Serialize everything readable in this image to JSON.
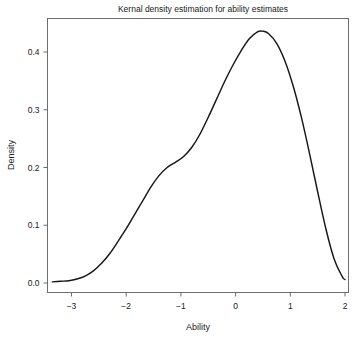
{
  "chart_data": {
    "type": "line",
    "title": "Kernal density estimation for ability estimates",
    "xlabel": "Ability",
    "ylabel": "Density",
    "xlim": [
      -3.35,
      2.0
    ],
    "ylim": [
      0.0,
      0.46
    ],
    "xticks": [
      -3,
      -2,
      -1,
      0,
      1,
      2
    ],
    "xtick_labels": [
      "−3",
      "−2",
      "−1",
      "0",
      "1",
      "2"
    ],
    "yticks": [
      0.0,
      0.1,
      0.2,
      0.3,
      0.4
    ],
    "ytick_labels": [
      "0.0",
      "0.1",
      "0.2",
      "0.3",
      "0.4"
    ],
    "grid": false,
    "legend": "none",
    "series": [
      {
        "name": "Density",
        "x": [
          -3.35,
          -3.2,
          -3.05,
          -2.9,
          -2.75,
          -2.6,
          -2.45,
          -2.3,
          -2.15,
          -2.0,
          -1.85,
          -1.7,
          -1.55,
          -1.4,
          -1.25,
          -1.1,
          -0.95,
          -0.8,
          -0.65,
          -0.5,
          -0.35,
          -0.2,
          -0.05,
          0.1,
          0.25,
          0.4,
          0.5,
          0.6,
          0.75,
          0.9,
          1.05,
          1.2,
          1.35,
          1.5,
          1.65,
          1.8,
          1.95,
          2.0
        ],
        "y": [
          0.002,
          0.003,
          0.004,
          0.007,
          0.012,
          0.021,
          0.034,
          0.051,
          0.072,
          0.094,
          0.118,
          0.142,
          0.166,
          0.186,
          0.2,
          0.209,
          0.219,
          0.235,
          0.258,
          0.287,
          0.318,
          0.349,
          0.377,
          0.402,
          0.423,
          0.435,
          0.436,
          0.432,
          0.415,
          0.385,
          0.342,
          0.288,
          0.225,
          0.158,
          0.094,
          0.042,
          0.011,
          0.006
        ]
      }
    ],
    "annotations": {
      "peak_x": 0.45,
      "peak_y": 0.436
    }
  },
  "figure": {
    "caption_partial": ""
  }
}
